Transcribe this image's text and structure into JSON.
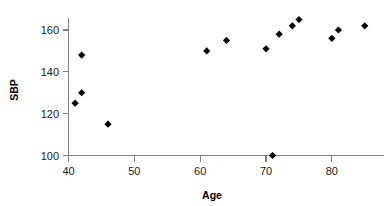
{
  "chart_data": {
    "type": "scatter",
    "title": "",
    "xlabel": "Age",
    "ylabel": "SBP",
    "xlim": [
      38,
      87
    ],
    "ylim": [
      96,
      170
    ],
    "xticks": [
      40,
      50,
      60,
      70,
      80
    ],
    "yticks": [
      100,
      120,
      140,
      160
    ],
    "grid": false,
    "legend": null,
    "marker": "diamond",
    "marker_color": "#000000",
    "axis_color": "#808080",
    "series": [
      {
        "name": "SBP vs Age",
        "points": [
          {
            "x": 41,
            "y": 125
          },
          {
            "x": 42,
            "y": 130
          },
          {
            "x": 42,
            "y": 148
          },
          {
            "x": 46,
            "y": 115
          },
          {
            "x": 61,
            "y": 150
          },
          {
            "x": 64,
            "y": 155
          },
          {
            "x": 70,
            "y": 151
          },
          {
            "x": 71,
            "y": 100
          },
          {
            "x": 72,
            "y": 158
          },
          {
            "x": 74,
            "y": 162
          },
          {
            "x": 75,
            "y": 165
          },
          {
            "x": 80,
            "y": 156
          },
          {
            "x": 81,
            "y": 160
          },
          {
            "x": 85,
            "y": 162
          }
        ]
      }
    ]
  },
  "axes": {
    "x_title": "Age",
    "y_title": "SBP",
    "x_tick_labels": [
      "40",
      "50",
      "60",
      "70",
      "80"
    ],
    "y_tick_labels": [
      "100",
      "120",
      "140",
      "160"
    ]
  }
}
